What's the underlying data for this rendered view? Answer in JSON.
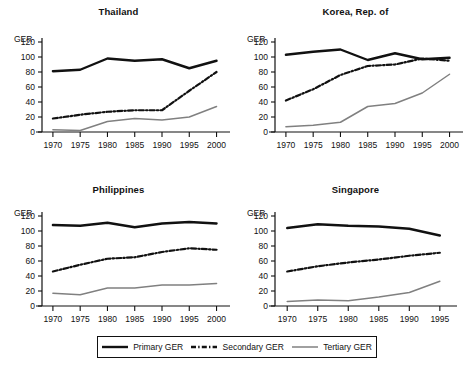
{
  "figure": {
    "axis_label": "GER",
    "y_ticks": [
      0,
      20,
      40,
      60,
      80,
      100,
      120
    ],
    "legend": {
      "items": [
        {
          "label": "Primary GER",
          "style": "solid-thick-black",
          "color": "#111111"
        },
        {
          "label": "Secondary GER",
          "style": "dash-dot-black",
          "color": "#111111"
        },
        {
          "label": "Tertiary GER",
          "style": "solid-thin-gray",
          "color": "#808080"
        }
      ]
    }
  },
  "chart_data": [
    {
      "type": "line",
      "title": "Thailand",
      "xlabel": "",
      "ylabel": "GER",
      "x": [
        1970,
        1975,
        1980,
        1985,
        1990,
        1995,
        2000
      ],
      "xlim": [
        1968,
        2001
      ],
      "ylim": [
        0,
        120
      ],
      "yticks": [
        0,
        20,
        40,
        60,
        80,
        100,
        120
      ],
      "grid": false,
      "legend_position": "bottom-figure",
      "series": [
        {
          "name": "Primary GER",
          "values": [
            81,
            83,
            98,
            95,
            97,
            85,
            95
          ]
        },
        {
          "name": "Secondary GER",
          "values": [
            18,
            23,
            27,
            29,
            29,
            55,
            80
          ]
        },
        {
          "name": "Tertiary GER",
          "values": [
            3,
            2,
            14,
            18,
            16,
            20,
            34
          ]
        }
      ]
    },
    {
      "type": "line",
      "title": "Korea, Rep. of",
      "xlabel": "",
      "ylabel": "GER",
      "x": [
        1970,
        1975,
        1980,
        1985,
        1990,
        1995,
        2000
      ],
      "xlim": [
        1968,
        2001
      ],
      "ylim": [
        0,
        120
      ],
      "yticks": [
        0,
        20,
        40,
        60,
        80,
        100,
        120
      ],
      "grid": false,
      "legend_position": "bottom-figure",
      "series": [
        {
          "name": "Primary GER",
          "values": [
            103,
            107,
            110,
            96,
            105,
            97,
            99
          ]
        },
        {
          "name": "Secondary GER",
          "values": [
            42,
            57,
            76,
            88,
            90,
            98,
            95
          ]
        },
        {
          "name": "Tertiary GER",
          "values": [
            7,
            9,
            13,
            34,
            38,
            52,
            77
          ]
        }
      ]
    },
    {
      "type": "line",
      "title": "Philippines",
      "xlabel": "",
      "ylabel": "GER",
      "x": [
        1970,
        1975,
        1980,
        1985,
        1990,
        1995,
        2000
      ],
      "xlim": [
        1968,
        2001
      ],
      "ylim": [
        0,
        120
      ],
      "yticks": [
        0,
        20,
        40,
        60,
        80,
        100,
        120
      ],
      "grid": false,
      "legend_position": "bottom-figure",
      "series": [
        {
          "name": "Primary GER",
          "values": [
            108,
            107,
            111,
            105,
            110,
            112,
            110
          ]
        },
        {
          "name": "Secondary GER",
          "values": [
            46,
            55,
            63,
            65,
            72,
            77,
            75
          ]
        },
        {
          "name": "Tertiary GER",
          "values": [
            17,
            15,
            24,
            24,
            28,
            28,
            30
          ]
        }
      ]
    },
    {
      "type": "line",
      "title": "Singapore",
      "xlabel": "",
      "ylabel": "GER",
      "x": [
        1970,
        1975,
        1980,
        1985,
        1990,
        1995
      ],
      "xlim": [
        1968,
        1996.5
      ],
      "ylim": [
        0,
        120
      ],
      "yticks": [
        0,
        20,
        40,
        60,
        80,
        100,
        120
      ],
      "grid": false,
      "legend_position": "bottom-figure",
      "series": [
        {
          "name": "Primary GER",
          "values": [
            104,
            109,
            107,
            106,
            103,
            94
          ]
        },
        {
          "name": "Secondary GER",
          "values": [
            46,
            53,
            58,
            62,
            67,
            71
          ]
        },
        {
          "name": "Tertiary GER",
          "values": [
            6,
            8,
            7,
            12,
            18,
            33
          ]
        }
      ]
    }
  ]
}
